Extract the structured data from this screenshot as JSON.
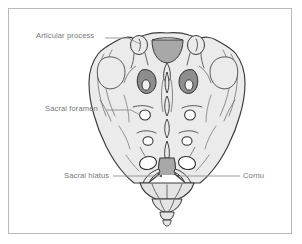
{
  "figure": {
    "type": "anatomical-line-diagram",
    "background_color": "#ffffff",
    "frame_color": "#b9b9b9",
    "bone_fill_color": "#ebebeb",
    "bone_outline_color": "#3a3a3a",
    "shadow_fill_color": "#9a9a9a",
    "canal_fill_color": "#a8a8a8",
    "label_color": "#76767a",
    "leader_color": "#8a8a8e"
  },
  "labels": [
    {
      "id": "articular-process",
      "text": "Articular process",
      "position": "upper-left"
    },
    {
      "id": "sacral-foramen",
      "text": "Sacral foramen",
      "position": "middle-left"
    },
    {
      "id": "sacral-hiatus",
      "text": "Sacral hiatus",
      "position": "lower-left"
    },
    {
      "id": "cornu",
      "text": "Cornu",
      "position": "lower-right"
    }
  ]
}
